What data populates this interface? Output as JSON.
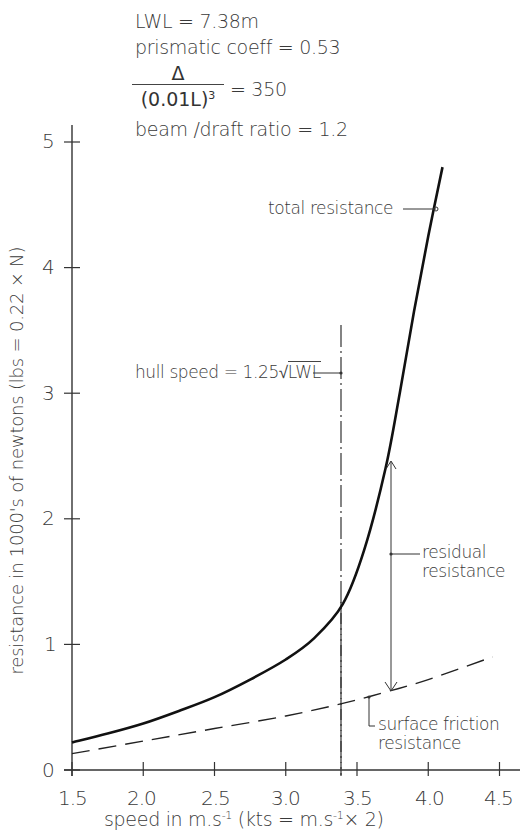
{
  "chart_data": {
    "type": "line",
    "title": "",
    "spec": {
      "lwl": "LWL = 7.38m",
      "prismatic": "prismatic coeff = 0.53",
      "disp_num": "Δ",
      "disp_den": "(0.01L)",
      "disp_den_exp": "3",
      "disp_eq": "=  350",
      "beam_draft": "beam /draft ratio = 1.2"
    },
    "xlabel": "speed  in  m.s⁻¹ (kts = m.s⁻¹× 2)",
    "ylabel": "resistance in 1000's of newtons  (lbs = 0.22 × N)",
    "xlim": [
      1.5,
      4.6
    ],
    "ylim": [
      0,
      5.2
    ],
    "x_ticks": [
      "1.5",
      "2.0",
      "2.5",
      "3.0",
      "3.5",
      "4.0",
      "4.5"
    ],
    "y_ticks": [
      "0",
      "1",
      "2",
      "3",
      "4",
      "5"
    ],
    "grid": false,
    "series": [
      {
        "name": "total resistance",
        "style": "solid",
        "x": [
          1.5,
          1.75,
          2.0,
          2.25,
          2.5,
          2.75,
          3.0,
          3.2,
          3.4,
          3.55,
          3.7,
          3.8,
          3.9,
          4.0,
          4.1
        ],
        "y": [
          0.22,
          0.29,
          0.37,
          0.47,
          0.58,
          0.72,
          0.88,
          1.05,
          1.32,
          1.75,
          2.4,
          3.0,
          3.65,
          4.25,
          4.8
        ]
      },
      {
        "name": "surface friction resistance",
        "style": "dashed",
        "x": [
          1.5,
          2.0,
          2.5,
          3.0,
          3.4,
          3.7,
          4.0,
          4.45
        ],
        "y": [
          0.13,
          0.23,
          0.33,
          0.43,
          0.53,
          0.62,
          0.72,
          0.9
        ]
      }
    ],
    "annotations": [
      {
        "label": "total resistance",
        "x": 4.05,
        "y": 4.47
      },
      {
        "label": "hull speed = 1.25√LWL",
        "x": 3.4,
        "y": 3.18,
        "type": "vertical-dash-dot-line",
        "x_value": 3.4
      },
      {
        "label": "residual resistance",
        "x": 3.72,
        "y": 1.72,
        "range": [
          0.62,
          2.45
        ]
      },
      {
        "label": "surface friction resistance",
        "x": 3.58,
        "y": 0.58
      }
    ]
  },
  "labels": {
    "hull_speed": "hull speed = 1.25",
    "hull_speed_root": "LWL",
    "total": "total resistance",
    "residual_1": "residual",
    "residual_2": "resistance",
    "friction_1": "surface friction",
    "friction_2": "resistance",
    "xlabel": "speed   in  m.s",
    "xlabel_sup": "-1",
    "xlabel_paren": "(kts = m.s",
    "xlabel_paren_sup": "-1",
    "xlabel_tail": "× 2)",
    "ylabel": "resistance in 1000's of newtons  (lbs = 0.22 × N)"
  }
}
